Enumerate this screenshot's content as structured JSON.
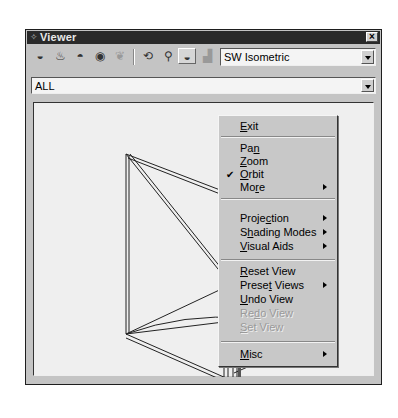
{
  "window": {
    "title": "Viewer",
    "title_icon": "app-icon",
    "close_label": "×"
  },
  "toolbar": {
    "buttons": [
      {
        "name": "shaded-view-icon",
        "glyph": "◒",
        "active": false,
        "disabled": false
      },
      {
        "name": "shaded-edges-icon",
        "glyph": "♨",
        "active": false,
        "disabled": false
      },
      {
        "name": "wireframe-view-icon",
        "glyph": "◓",
        "active": false,
        "disabled": false
      },
      {
        "name": "hidden-line-icon",
        "glyph": "◉",
        "active": false,
        "disabled": false
      },
      {
        "name": "texture-view-icon",
        "glyph": "❦",
        "active": false,
        "disabled": true
      },
      {
        "name": "orbit-tool-icon",
        "glyph": "⟲",
        "active": false,
        "disabled": false
      },
      {
        "name": "zoom-tool-icon",
        "glyph": "⚲",
        "active": false,
        "disabled": false
      },
      {
        "name": "view-object-icon",
        "glyph": "◒",
        "active": true,
        "disabled": false
      },
      {
        "name": "ground-plane-icon",
        "glyph": "▟",
        "active": false,
        "disabled": true
      }
    ],
    "view_select": {
      "value": "SW Isometric"
    }
  },
  "filter_select": {
    "value": "ALL"
  },
  "context_menu": {
    "items": [
      {
        "label": "Exit",
        "underline": "E",
        "checked": false,
        "submenu": false,
        "disabled": false
      },
      {
        "type": "separator"
      },
      {
        "label": "Pan",
        "underline": "n",
        "checked": false,
        "submenu": false,
        "disabled": false
      },
      {
        "label": "Zoom",
        "underline": "Z",
        "checked": false,
        "submenu": false,
        "disabled": false
      },
      {
        "label": "Orbit",
        "underline": "O",
        "checked": true,
        "submenu": false,
        "disabled": false
      },
      {
        "label": "More",
        "underline": "r",
        "checked": false,
        "submenu": true,
        "disabled": false
      },
      {
        "type": "separator"
      },
      {
        "label": "Projection",
        "underline": "c",
        "checked": false,
        "submenu": true,
        "disabled": false
      },
      {
        "label": "Shading Modes",
        "underline": "h",
        "checked": false,
        "submenu": true,
        "disabled": false
      },
      {
        "label": "Visual Aids",
        "underline": "V",
        "checked": false,
        "submenu": true,
        "disabled": false
      },
      {
        "type": "separator"
      },
      {
        "label": "Reset View",
        "underline": "R",
        "checked": false,
        "submenu": false,
        "disabled": false
      },
      {
        "label": "Preset Views",
        "underline": "t",
        "checked": false,
        "submenu": true,
        "disabled": false
      },
      {
        "label": "Undo View",
        "underline": "U",
        "checked": false,
        "submenu": false,
        "disabled": false
      },
      {
        "label": "Redo View",
        "underline": "d",
        "checked": false,
        "submenu": false,
        "disabled": true
      },
      {
        "label": "Set View",
        "underline": "S",
        "checked": false,
        "submenu": false,
        "disabled": true
      },
      {
        "type": "separator"
      },
      {
        "label": "Misc",
        "underline": "M",
        "checked": false,
        "submenu": true,
        "disabled": false
      }
    ],
    "check_glyph": "✔"
  }
}
